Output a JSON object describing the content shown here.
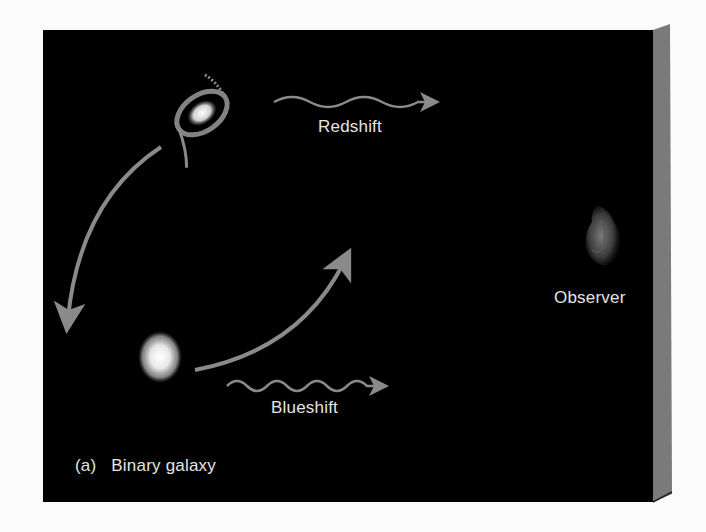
{
  "figure": {
    "caption_prefix": "(a)",
    "caption": "Binary galaxy",
    "labels": {
      "redshift": "Redshift",
      "blueshift": "Blueshift",
      "observer": "Observer"
    },
    "colors": {
      "panel": "#000000",
      "side_face": "#7a7a7a",
      "arrow": "#8a8a8a",
      "text": "#e4e4e4",
      "background": "#fbfbfb"
    },
    "elements": [
      {
        "name": "spiral-galaxy",
        "description": "spiral galaxy moving away from observer"
      },
      {
        "name": "elliptical-galaxy",
        "description": "elliptical galaxy moving toward observer"
      },
      {
        "name": "orbit-arrows",
        "description": "curved arrows showing orbital motion"
      },
      {
        "name": "redshift-wave",
        "description": "wavy arrow pointing to the right"
      },
      {
        "name": "blueshift-wave",
        "description": "wavy arrow pointing to the right"
      },
      {
        "name": "observer",
        "description": "silhouette of an observer's face"
      }
    ]
  }
}
